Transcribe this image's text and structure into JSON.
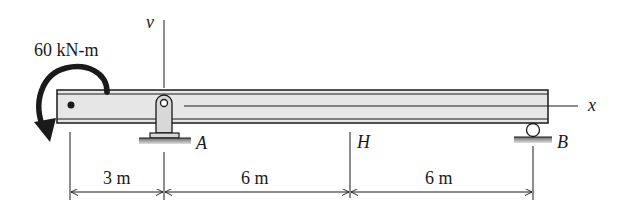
{
  "diagram": {
    "type": "simply supported beam with overhang",
    "moment": {
      "label": "60 kN-m",
      "direction": "counterclockwise"
    },
    "axes": {
      "vertical": "v",
      "horizontal": "x"
    },
    "points": {
      "A": "A",
      "H": "H",
      "B": "B"
    },
    "supports": [
      {
        "point": "A",
        "type": "pin"
      },
      {
        "point": "B",
        "type": "roller"
      }
    ],
    "dimensions": [
      {
        "label": "3 m"
      },
      {
        "label": "6 m"
      },
      {
        "label": "6 m"
      }
    ],
    "colors": {
      "beam_fill": "#e6e6e6",
      "stroke": "#1a1a1a",
      "ground": "#9a9a9a"
    }
  }
}
